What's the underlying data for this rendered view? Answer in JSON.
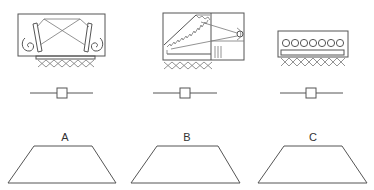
{
  "diagram": {
    "panels": [
      {
        "id": "A",
        "label": "A",
        "fixture": "luminaire with two reflectors and crossed light paths",
        "slider": {
          "name": "dimmer-slider"
        },
        "shape": "trapezoid"
      },
      {
        "id": "B",
        "label": "B",
        "fixture": "luminaire with stepped reflector and side lamp",
        "slider": {
          "name": "dimmer-slider"
        },
        "shape": "trapezoid"
      },
      {
        "id": "C",
        "label": "C",
        "fixture": "luminaire with row of seven lamps",
        "slider": {
          "name": "dimmer-slider"
        },
        "shape": "trapezoid"
      }
    ],
    "colors": {
      "line": "#555555",
      "background": "#ffffff",
      "text": "#333333"
    }
  }
}
